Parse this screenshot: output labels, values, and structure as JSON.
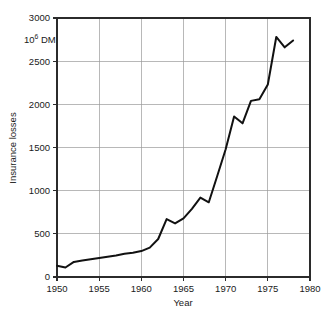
{
  "chart_data": {
    "type": "line",
    "title": "",
    "xlabel": "Year",
    "ylabel": "Insurance losses",
    "unit_label": "10",
    "unit_exponent": "6",
    "unit_suffix": " DM",
    "xlim": [
      1950,
      1980
    ],
    "ylim": [
      0,
      3000
    ],
    "xticks": [
      1950,
      1955,
      1960,
      1965,
      1970,
      1975,
      1980
    ],
    "xtick_labels": [
      "1950",
      "1955",
      "1960",
      "1965",
      "1970",
      "1975",
      "1980"
    ],
    "yticks": [
      0,
      500,
      1000,
      1500,
      2000,
      2500,
      3000
    ],
    "ytick_labels": [
      "0",
      "500",
      "1000",
      "1500",
      "2000",
      "2500",
      "3000"
    ],
    "grid": true,
    "legend": "none",
    "line_color": "#111111",
    "grid_color": "#9a9a9a",
    "frame_color": "#2b2b2b",
    "background_color": "#ffffff",
    "x": [
      1950,
      1951,
      1952,
      1953,
      1954,
      1955,
      1956,
      1957,
      1958,
      1959,
      1960,
      1961,
      1962,
      1963,
      1964,
      1965,
      1966,
      1967,
      1968,
      1969,
      1970,
      1971,
      1972,
      1973,
      1974,
      1975,
      1976,
      1977,
      1978
    ],
    "values": [
      130,
      110,
      175,
      190,
      205,
      220,
      235,
      250,
      270,
      280,
      300,
      340,
      440,
      670,
      620,
      680,
      790,
      920,
      865,
      1170,
      1480,
      1860,
      1780,
      2040,
      2060,
      2230,
      2780,
      2660,
      2740
    ],
    "series": [
      {
        "name": "Insurance losses",
        "values": [
          130,
          110,
          175,
          190,
          205,
          220,
          235,
          250,
          270,
          280,
          300,
          340,
          440,
          670,
          620,
          680,
          790,
          920,
          865,
          1170,
          1480,
          1860,
          1780,
          2040,
          2060,
          2230,
          2780,
          2660,
          2740
        ]
      }
    ]
  }
}
